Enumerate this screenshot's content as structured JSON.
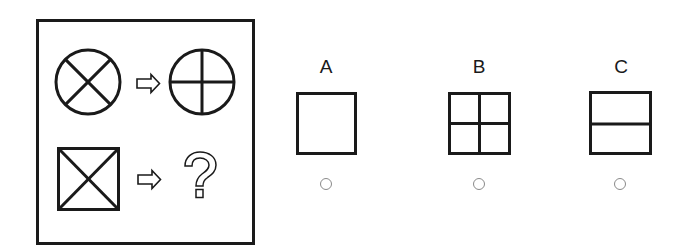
{
  "puzzle": {
    "question_panel": {
      "rows": [
        {
          "source_shape": "circle-with-diagonal-cross",
          "arrow": "right-arrow",
          "result_shape": "circle-with-orthogonal-cross"
        },
        {
          "source_shape": "square-with-diagonal-cross",
          "arrow": "right-arrow",
          "result_shape": "unknown",
          "result_glyph": "?"
        }
      ]
    },
    "options": [
      {
        "label": "A",
        "shape": "empty-square",
        "selected": false
      },
      {
        "label": "B",
        "shape": "square-with-orthogonal-cross",
        "selected": false
      },
      {
        "label": "C",
        "shape": "square-with-horizontal-line",
        "selected": false
      }
    ],
    "colors": {
      "stroke": "#1a1a1a",
      "radio": "#8a8a8a",
      "background": "#ffffff"
    }
  }
}
